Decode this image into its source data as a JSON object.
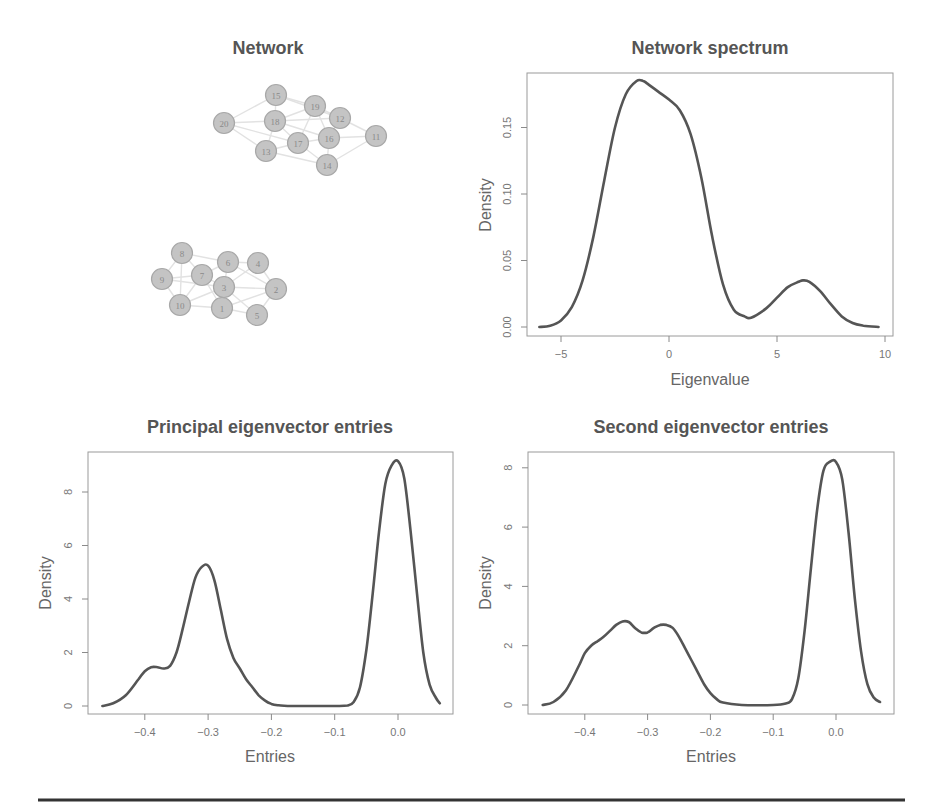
{
  "figure": {
    "panels": [
      {
        "id": "network",
        "title": "Network"
      },
      {
        "id": "spectrum",
        "title": "Network spectrum",
        "xlabel": "Eigenvalue",
        "ylabel": "Density"
      },
      {
        "id": "principal",
        "title": "Principal eigenvector entries",
        "xlabel": "Entries",
        "ylabel": "Density"
      },
      {
        "id": "second",
        "title": "Second eigenvector entries",
        "xlabel": "Entries",
        "ylabel": "Density"
      }
    ],
    "colors": {
      "curve": "#555555",
      "node_fill": "#c4c4c4",
      "edge": "#e2e2e2",
      "title": "#555555"
    }
  },
  "chart_data": [
    {
      "type": "network",
      "title": "Network",
      "nodes": [
        {
          "id": "20",
          "x": 224,
          "y": 123
        },
        {
          "id": "15",
          "x": 276,
          "y": 95
        },
        {
          "id": "18",
          "x": 275,
          "y": 121
        },
        {
          "id": "19",
          "x": 315,
          "y": 106
        },
        {
          "id": "12",
          "x": 340,
          "y": 118
        },
        {
          "id": "13",
          "x": 266,
          "y": 151
        },
        {
          "id": "17",
          "x": 298,
          "y": 143
        },
        {
          "id": "16",
          "x": 329,
          "y": 138
        },
        {
          "id": "14",
          "x": 327,
          "y": 165
        },
        {
          "id": "11",
          "x": 376,
          "y": 136
        },
        {
          "id": "8",
          "x": 182,
          "y": 253
        },
        {
          "id": "9",
          "x": 162,
          "y": 279
        },
        {
          "id": "7",
          "x": 202,
          "y": 275
        },
        {
          "id": "6",
          "x": 228,
          "y": 262
        },
        {
          "id": "4",
          "x": 258,
          "y": 263
        },
        {
          "id": "3",
          "x": 224,
          "y": 287
        },
        {
          "id": "2",
          "x": 276,
          "y": 289
        },
        {
          "id": "10",
          "x": 180,
          "y": 305
        },
        {
          "id": "1",
          "x": 222,
          "y": 308
        },
        {
          "id": "5",
          "x": 257,
          "y": 315
        }
      ],
      "edges": [
        [
          "20",
          "15"
        ],
        [
          "20",
          "18"
        ],
        [
          "20",
          "13"
        ],
        [
          "20",
          "17"
        ],
        [
          "15",
          "19"
        ],
        [
          "15",
          "18"
        ],
        [
          "15",
          "12"
        ],
        [
          "18",
          "19"
        ],
        [
          "18",
          "17"
        ],
        [
          "18",
          "16"
        ],
        [
          "18",
          "12"
        ],
        [
          "19",
          "12"
        ],
        [
          "19",
          "16"
        ],
        [
          "19",
          "17"
        ],
        [
          "12",
          "11"
        ],
        [
          "12",
          "16"
        ],
        [
          "16",
          "11"
        ],
        [
          "16",
          "14"
        ],
        [
          "16",
          "17"
        ],
        [
          "17",
          "13"
        ],
        [
          "17",
          "14"
        ],
        [
          "13",
          "14"
        ],
        [
          "13",
          "18"
        ],
        [
          "14",
          "11"
        ],
        [
          "8",
          "6"
        ],
        [
          "8",
          "9"
        ],
        [
          "8",
          "7"
        ],
        [
          "8",
          "10"
        ],
        [
          "9",
          "7"
        ],
        [
          "9",
          "10"
        ],
        [
          "9",
          "3"
        ],
        [
          "7",
          "6"
        ],
        [
          "7",
          "3"
        ],
        [
          "7",
          "1"
        ],
        [
          "7",
          "10"
        ],
        [
          "6",
          "4"
        ],
        [
          "6",
          "3"
        ],
        [
          "6",
          "2"
        ],
        [
          "4",
          "2"
        ],
        [
          "4",
          "3"
        ],
        [
          "3",
          "2"
        ],
        [
          "3",
          "1"
        ],
        [
          "3",
          "5"
        ],
        [
          "10",
          "1"
        ],
        [
          "10",
          "3"
        ],
        [
          "1",
          "5"
        ],
        [
          "1",
          "2"
        ],
        [
          "5",
          "2"
        ]
      ]
    },
    {
      "type": "line",
      "title": "Network spectrum",
      "xlabel": "Eigenvalue",
      "ylabel": "Density",
      "xlim": [
        -6.0,
        9.7
      ],
      "ylim": [
        0.0,
        0.185
      ],
      "xticks": [
        -5,
        0,
        5,
        10
      ],
      "yticks": [
        "0.00",
        "0.05",
        "0.10",
        "0.15"
      ],
      "x": [
        -6.0,
        -5.5,
        -5.0,
        -4.5,
        -4.0,
        -3.5,
        -3.0,
        -2.5,
        -2.0,
        -1.5,
        -1.2,
        -1.0,
        -0.5,
        0.0,
        0.5,
        1.0,
        1.5,
        2.0,
        2.5,
        3.0,
        3.5,
        3.8,
        4.5,
        5.0,
        5.5,
        6.0,
        6.2,
        6.5,
        7.0,
        7.5,
        8.0,
        8.5,
        9.0,
        9.7
      ],
      "y": [
        0.0,
        0.001,
        0.005,
        0.015,
        0.035,
        0.068,
        0.11,
        0.15,
        0.175,
        0.185,
        0.185,
        0.183,
        0.177,
        0.171,
        0.163,
        0.145,
        0.112,
        0.068,
        0.032,
        0.013,
        0.008,
        0.007,
        0.014,
        0.022,
        0.03,
        0.034,
        0.035,
        0.034,
        0.027,
        0.017,
        0.008,
        0.003,
        0.001,
        0.0
      ],
      "grid": false,
      "legend": null
    },
    {
      "type": "line",
      "title": "Principal eigenvector entries",
      "xlabel": "Entries",
      "ylabel": "Density",
      "xlim": [
        -0.47,
        0.07
      ],
      "ylim": [
        0,
        9.2
      ],
      "xticks": [
        "-0.4",
        "-0.3",
        "-0.2",
        "-0.1",
        "0.0"
      ],
      "yticks": [
        "0",
        "2",
        "4",
        "6",
        "8"
      ],
      "x": [
        -0.467,
        -0.45,
        -0.43,
        -0.41,
        -0.4,
        -0.39,
        -0.38,
        -0.37,
        -0.36,
        -0.35,
        -0.34,
        -0.33,
        -0.32,
        -0.31,
        -0.3,
        -0.29,
        -0.28,
        -0.27,
        -0.26,
        -0.25,
        -0.24,
        -0.23,
        -0.22,
        -0.21,
        -0.2,
        -0.19,
        -0.18,
        -0.15,
        -0.1,
        -0.08,
        -0.07,
        -0.06,
        -0.05,
        -0.04,
        -0.03,
        -0.02,
        -0.01,
        0.0,
        0.01,
        0.02,
        0.03,
        0.04,
        0.05,
        0.06,
        0.066
      ],
      "y": [
        0.0,
        0.1,
        0.4,
        1.0,
        1.3,
        1.45,
        1.45,
        1.4,
        1.5,
        2.0,
        2.9,
        3.9,
        4.8,
        5.2,
        5.25,
        4.7,
        3.6,
        2.5,
        1.8,
        1.4,
        1.0,
        0.7,
        0.4,
        0.2,
        0.08,
        0.03,
        0.01,
        0.0,
        0.0,
        0.02,
        0.15,
        0.7,
        2.1,
        4.2,
        6.5,
        8.3,
        9.0,
        9.15,
        8.5,
        6.5,
        4.2,
        2.0,
        0.8,
        0.3,
        0.1
      ],
      "grid": false,
      "legend": null
    },
    {
      "type": "line",
      "title": "Second eigenvector entries",
      "xlabel": "Entries",
      "ylabel": "Density",
      "xlim": [
        -0.47,
        0.07
      ],
      "ylim": [
        0,
        8.2
      ],
      "xticks": [
        "-0.4",
        "-0.3",
        "-0.2",
        "-0.1",
        "0.0"
      ],
      "yticks": [
        "0",
        "2",
        "4",
        "6",
        "8"
      ],
      "x": [
        -0.467,
        -0.45,
        -0.43,
        -0.41,
        -0.4,
        -0.39,
        -0.38,
        -0.37,
        -0.36,
        -0.35,
        -0.34,
        -0.33,
        -0.32,
        -0.31,
        -0.3,
        -0.29,
        -0.28,
        -0.27,
        -0.26,
        -0.25,
        -0.24,
        -0.23,
        -0.22,
        -0.21,
        -0.2,
        -0.19,
        -0.18,
        -0.15,
        -0.1,
        -0.08,
        -0.07,
        -0.06,
        -0.05,
        -0.04,
        -0.03,
        -0.02,
        -0.01,
        0.0,
        0.01,
        0.02,
        0.03,
        0.04,
        0.05,
        0.06,
        0.07
      ],
      "y": [
        0.0,
        0.1,
        0.5,
        1.3,
        1.75,
        2.0,
        2.15,
        2.3,
        2.5,
        2.7,
        2.82,
        2.8,
        2.6,
        2.45,
        2.45,
        2.6,
        2.7,
        2.7,
        2.6,
        2.3,
        1.9,
        1.5,
        1.1,
        0.7,
        0.4,
        0.2,
        0.08,
        0.0,
        0.0,
        0.05,
        0.2,
        0.9,
        2.5,
        4.6,
        6.6,
        7.9,
        8.2,
        8.2,
        7.6,
        5.8,
        3.6,
        1.8,
        0.7,
        0.25,
        0.1
      ],
      "grid": false,
      "legend": null
    }
  ]
}
